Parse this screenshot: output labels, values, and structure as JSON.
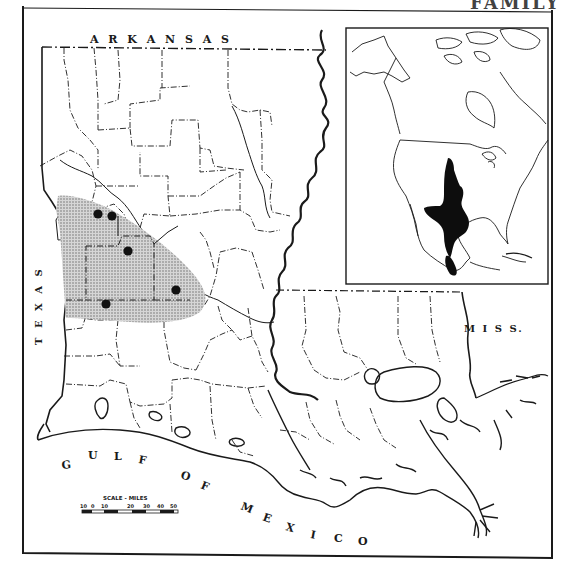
{
  "page": {
    "header_fragment": "FAMILY",
    "figure_type": "range map"
  },
  "map": {
    "state_labels": {
      "north": "A R K A N S A S",
      "west": "T E X A S",
      "east": "M I S S.",
      "gulf_1": "G U L F",
      "gulf_2": "O F",
      "gulf_3": "M E X I C O"
    },
    "scale": {
      "title": "SCALE - MILES",
      "ticks": [
        "10",
        "0",
        "10",
        "20",
        "30",
        "40",
        "50"
      ]
    },
    "inset": {
      "description": "North America with species range shaded black",
      "range_color": "#0d0d0d"
    },
    "range": {
      "shaded_region_color": "#b8b8b8",
      "locality_count": 6,
      "localities": [
        {
          "x": 98,
          "y": 214
        },
        {
          "x": 112,
          "y": 216
        },
        {
          "x": 128,
          "y": 251
        },
        {
          "x": 176,
          "y": 290
        },
        {
          "x": 106,
          "y": 304
        }
      ]
    },
    "colors": {
      "line": "#1a1a1a",
      "background": "#ffffff",
      "stipple": "#9a9a9a"
    }
  }
}
